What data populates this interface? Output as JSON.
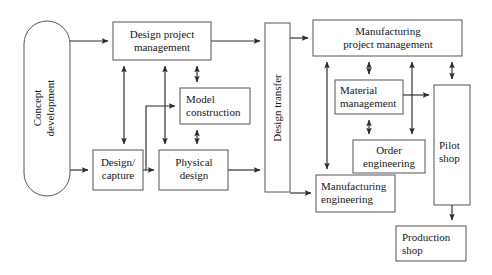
{
  "diagram": {
    "canvas": {
      "width": 492,
      "height": 275
    },
    "colors": {
      "background": "#ffffff",
      "node_stroke": "#55555a",
      "node_fill": "#ffffff",
      "connector": "#2b2b2f",
      "text": "#17171a"
    },
    "nodes": [
      {
        "id": "concept-development",
        "label": "Concept development",
        "lines": [
          "Concept",
          "development"
        ],
        "shape": "stadium",
        "orientation": "vertical",
        "x": 24,
        "y": 21,
        "w": 46,
        "h": 175
      },
      {
        "id": "design-project-management",
        "label": "Design project management",
        "lines": [
          "Design project",
          "management"
        ],
        "shape": "rect",
        "orientation": "horizontal",
        "x": 113,
        "y": 22,
        "w": 98,
        "h": 38
      },
      {
        "id": "model-construction",
        "label": "Model construction",
        "lines": [
          "Model",
          "construction"
        ],
        "shape": "rect",
        "orientation": "horizontal",
        "x": 180,
        "y": 88,
        "w": 70,
        "h": 36
      },
      {
        "id": "design-capture",
        "label": "Design/capture",
        "lines": [
          "Design/",
          "capture"
        ],
        "shape": "rect",
        "orientation": "horizontal",
        "x": 93,
        "y": 150,
        "w": 50,
        "h": 40
      },
      {
        "id": "physical-design",
        "label": "Physical design",
        "lines": [
          "Physical",
          "design"
        ],
        "shape": "rect",
        "orientation": "horizontal",
        "x": 159,
        "y": 150,
        "w": 69,
        "h": 40
      },
      {
        "id": "design-transfer",
        "label": "Design transfer",
        "lines": [
          "Design transfer"
        ],
        "shape": "rect",
        "orientation": "vertical",
        "x": 265,
        "y": 23,
        "w": 25,
        "h": 169
      },
      {
        "id": "manufacturing-project-management",
        "label": "Manufacturing project management",
        "lines": [
          "Manufacturing",
          "project management"
        ],
        "shape": "rect",
        "orientation": "horizontal",
        "x": 313,
        "y": 20,
        "w": 149,
        "h": 36
      },
      {
        "id": "material-management",
        "label": "Material management",
        "lines": [
          "Material",
          "management"
        ],
        "shape": "rect",
        "orientation": "horizontal",
        "x": 335,
        "y": 80,
        "w": 68,
        "h": 34
      },
      {
        "id": "order-engineering",
        "label": "Order engineering",
        "lines": [
          "Order",
          "engineering"
        ],
        "shape": "rect",
        "orientation": "horizontal",
        "x": 353,
        "y": 140,
        "w": 72,
        "h": 33
      },
      {
        "id": "pilot-shop",
        "label": "Pilot shop",
        "lines": [
          "Pilot",
          "shop"
        ],
        "shape": "rect",
        "orientation": "horizontal",
        "x": 434,
        "y": 85,
        "w": 36,
        "h": 120
      },
      {
        "id": "manufacturing-engineering",
        "label": "Manufacturing engineering",
        "lines": [
          "Manufacturing",
          "engineering"
        ],
        "shape": "rect",
        "orientation": "horizontal",
        "x": 316,
        "y": 175,
        "w": 79,
        "h": 37
      },
      {
        "id": "production-shop",
        "label": "Production shop",
        "lines": [
          "Production",
          "shop"
        ],
        "shape": "rect",
        "orientation": "horizontal",
        "x": 396,
        "y": 226,
        "w": 70,
        "h": 35
      }
    ],
    "connectors": [
      {
        "id": "concept-to-design-project-management",
        "from": "concept-development",
        "to": "design-project-management",
        "arrow": "single"
      },
      {
        "id": "concept-to-design-capture",
        "from": "concept-development",
        "to": "design-capture",
        "arrow": "single"
      },
      {
        "id": "design-project-management-to-design-capture",
        "from": "design-project-management",
        "to": "design-capture",
        "arrow": "double"
      },
      {
        "id": "design-project-management-to-physical-design",
        "from": "design-project-management",
        "to": "physical-design",
        "arrow": "double"
      },
      {
        "id": "design-project-management-to-model-construction",
        "from": "design-project-management",
        "to": "model-construction",
        "arrow": "double"
      },
      {
        "id": "model-construction-to-physical-design",
        "from": "model-construction",
        "to": "physical-design",
        "arrow": "double"
      },
      {
        "id": "design-capture-to-physical-design",
        "from": "design-capture",
        "to": "physical-design",
        "arrow": "single"
      },
      {
        "id": "design-capture-to-model-construction",
        "from": "design-capture",
        "to": "model-construction",
        "arrow": "single"
      },
      {
        "id": "design-project-management-to-design-transfer",
        "from": "design-project-management",
        "to": "design-transfer",
        "arrow": "single"
      },
      {
        "id": "physical-design-to-design-transfer",
        "from": "physical-design",
        "to": "design-transfer",
        "arrow": "single"
      },
      {
        "id": "design-transfer-to-manufacturing-project-management",
        "from": "design-transfer",
        "to": "manufacturing-project-management",
        "arrow": "single"
      },
      {
        "id": "design-transfer-to-manufacturing-engineering",
        "from": "design-transfer",
        "to": "manufacturing-engineering",
        "arrow": "single"
      },
      {
        "id": "manufacturing-project-management-to-material-management",
        "from": "manufacturing-project-management",
        "to": "material-management",
        "arrow": "double"
      },
      {
        "id": "manufacturing-project-management-to-order-engineering",
        "from": "manufacturing-project-management",
        "to": "order-engineering",
        "arrow": "double"
      },
      {
        "id": "manufacturing-project-management-to-pilot-shop",
        "from": "manufacturing-project-management",
        "to": "pilot-shop",
        "arrow": "double"
      },
      {
        "id": "manufacturing-project-management-to-manufacturing-engineering",
        "from": "manufacturing-project-management",
        "to": "manufacturing-engineering",
        "arrow": "double"
      },
      {
        "id": "material-management-to-order-engineering",
        "from": "material-management",
        "to": "order-engineering",
        "arrow": "double"
      },
      {
        "id": "material-management-to-pilot-shop",
        "from": "material-management",
        "to": "pilot-shop",
        "arrow": "single"
      },
      {
        "id": "pilot-shop-to-production-shop",
        "from": "pilot-shop",
        "to": "production-shop",
        "arrow": "single"
      }
    ]
  }
}
